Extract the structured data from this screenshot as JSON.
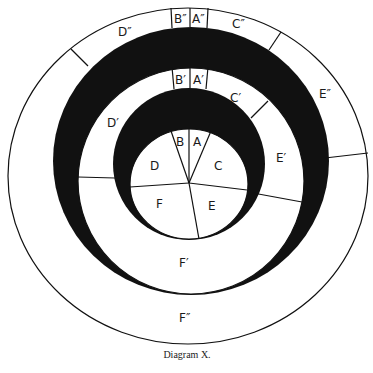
{
  "caption": "Diagram X.",
  "colors": {
    "ink": "#111111",
    "paper": "#ffffff"
  },
  "labels": {
    "inner": {
      "A": "A",
      "B": "B",
      "C": "C",
      "D": "D",
      "E": "E",
      "F": "F"
    },
    "middle": {
      "A": "A′",
      "B": "B′",
      "C": "C′",
      "D": "D′",
      "E": "E′",
      "F": "F′"
    },
    "outer": {
      "A": "A″",
      "B": "B″",
      "C": "C″",
      "D": "D″",
      "E": "E″",
      "F": "F″"
    }
  }
}
